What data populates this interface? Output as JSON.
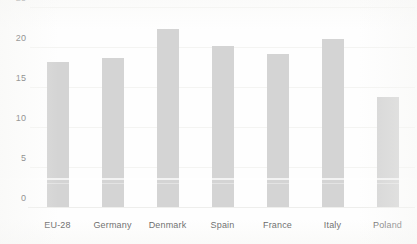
{
  "chart_data": {
    "type": "bar",
    "title": "",
    "subtitle": "",
    "xlabel": "",
    "ylabel": "",
    "categories": [
      "EU-28",
      "Germany",
      "Denmark",
      "Spain",
      "France",
      "Italy",
      "Poland"
    ],
    "values": [
      18.3,
      18.7,
      22.4,
      20.2,
      19.3,
      21.1,
      13.9
    ],
    "ylim": [
      0,
      25
    ],
    "ytick_labels": [
      "0",
      "5",
      "10",
      "15",
      "20",
      "25"
    ],
    "ytick_values": [
      0,
      5,
      10,
      15,
      20,
      25
    ],
    "grid": true,
    "legend": null,
    "legend_position": "none",
    "bar_color": "#d4d4d4",
    "axis_text_color": "#5e5e5e",
    "gridline_color": "#f4f4f2",
    "background_color": "#fefefe"
  }
}
